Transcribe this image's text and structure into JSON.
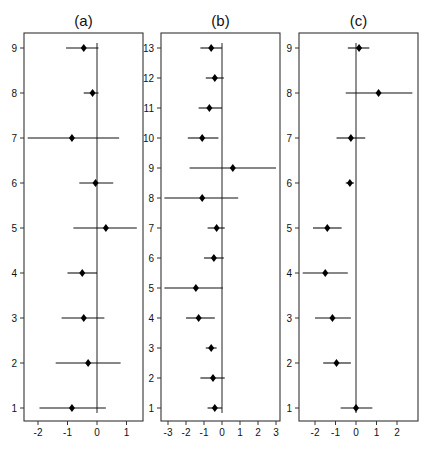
{
  "chart_data": [
    {
      "type": "forest",
      "title": "(a)",
      "xlabel": "",
      "ylabel": "",
      "xlim": [
        -2.5,
        1.55
      ],
      "xticks": [
        -2,
        -1,
        0,
        1
      ],
      "reference_line": 0,
      "categories": [
        "1",
        "2",
        "3",
        "4",
        "5",
        "6",
        "7",
        "8",
        "9"
      ],
      "estimates": [
        -0.85,
        -0.3,
        -0.45,
        -0.5,
        0.3,
        -0.05,
        -0.85,
        -0.15,
        -0.45
      ],
      "lower": [
        -1.95,
        -1.4,
        -1.2,
        -1.0,
        -0.8,
        -0.6,
        -2.35,
        -0.45,
        -1.05
      ],
      "upper": [
        0.3,
        0.8,
        0.25,
        0.0,
        1.35,
        0.55,
        0.75,
        0.05,
        0.05
      ]
    },
    {
      "type": "forest",
      "title": "(b)",
      "xlabel": "",
      "ylabel": "",
      "xlim": [
        -3.4,
        3.25
      ],
      "xticks": [
        -3,
        -2,
        -1,
        0,
        1,
        2,
        3
      ],
      "reference_line": 0,
      "categories": [
        "1",
        "2",
        "3",
        "4",
        "5",
        "6",
        "7",
        "8",
        "9",
        "10",
        "11",
        "12",
        "13"
      ],
      "estimates": [
        -0.4,
        -0.5,
        -0.6,
        -1.3,
        -1.45,
        -0.45,
        -0.3,
        -1.1,
        0.6,
        -1.1,
        -0.7,
        -0.4,
        -0.6
      ],
      "lower": [
        -0.8,
        -1.2,
        -0.9,
        -2.0,
        -3.2,
        -1.0,
        -0.8,
        -3.2,
        -1.8,
        -1.9,
        -1.3,
        -0.9,
        -1.2
      ],
      "upper": [
        0.0,
        0.15,
        -0.3,
        -0.4,
        0.05,
        0.1,
        0.15,
        0.9,
        3.0,
        -0.2,
        0.0,
        0.1,
        0.0
      ]
    },
    {
      "type": "forest",
      "title": "(c)",
      "xlabel": "",
      "ylabel": "",
      "xlim": [
        -2.75,
        3.0
      ],
      "xticks": [
        -2,
        -1,
        0,
        1,
        2
      ],
      "reference_line": 0,
      "categories": [
        "1",
        "2",
        "3",
        "4",
        "5",
        "6",
        "7",
        "8",
        "9"
      ],
      "estimates": [
        0.0,
        -0.95,
        -1.15,
        -1.5,
        -1.4,
        -0.3,
        -0.25,
        1.1,
        0.15
      ],
      "lower": [
        -0.75,
        -1.6,
        -2.0,
        -2.6,
        -2.1,
        -0.5,
        -0.95,
        -0.5,
        -0.4
      ],
      "upper": [
        0.8,
        -0.25,
        -0.25,
        -0.4,
        -0.7,
        -0.1,
        0.45,
        2.75,
        0.65
      ]
    }
  ],
  "panels": [
    {
      "title": "(a)",
      "frame": {
        "x0": 24,
        "x1": 143,
        "y0": 33,
        "y1": 421
      },
      "x_zero_px": 97,
      "px_per_unit": 29.5,
      "row_top_px": 48,
      "row_bottom_px": 408
    },
    {
      "title": "(b)",
      "frame": {
        "x0": 161,
        "x1": 280,
        "y0": 33,
        "y1": 421
      },
      "x_zero_px": 222,
      "px_per_unit": 18.0,
      "row_top_px": 48,
      "row_bottom_px": 408
    },
    {
      "title": "(c)",
      "frame": {
        "x0": 299,
        "x1": 418,
        "y0": 33,
        "y1": 421
      },
      "x_zero_px": 356,
      "px_per_unit": 20.5,
      "row_top_px": 48,
      "row_bottom_px": 408
    }
  ],
  "colors": {
    "line": "#111111",
    "frame": "#333333",
    "background": "#ffffff"
  }
}
